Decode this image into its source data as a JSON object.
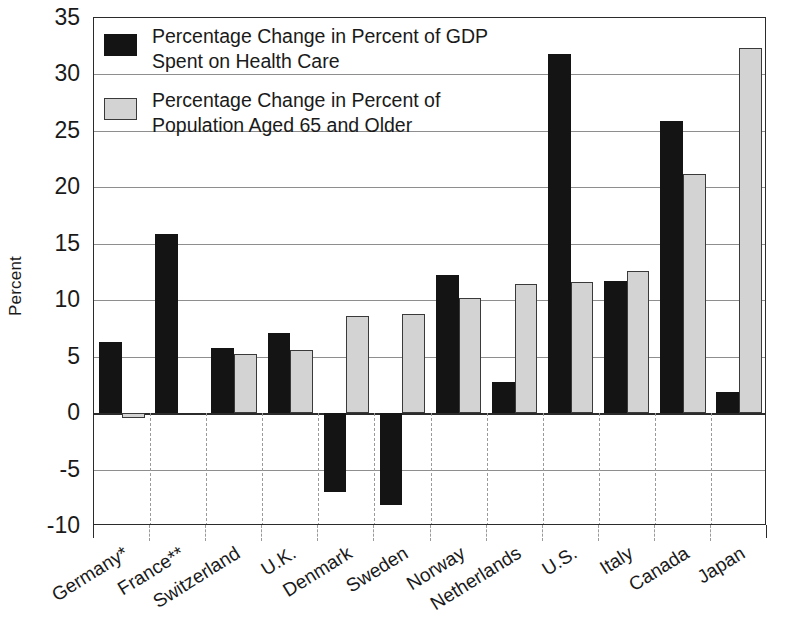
{
  "chart_data": {
    "type": "bar",
    "title": "",
    "xlabel": "",
    "ylabel": "Percent",
    "ylim": [
      -10,
      35
    ],
    "ytick_step": 5,
    "yticks": [
      "35",
      "30",
      "25",
      "20",
      "15",
      "10",
      "5",
      "0",
      "-5",
      "-10"
    ],
    "grid": true,
    "legend_position": "upper-left-inside",
    "categories": [
      "Germany*",
      "France**",
      "Switzerland",
      "U.K.",
      "Denmark",
      "Sweden",
      "Norway",
      "Netherlands",
      "U.S.",
      "Italy",
      "Canada",
      "Japan"
    ],
    "series": [
      {
        "name": "Percentage Change in Percent of GDP Spent on Health Care",
        "color": "#141414",
        "values": [
          6.3,
          15.9,
          5.8,
          7.1,
          -7.0,
          -8.1,
          12.2,
          2.8,
          31.8,
          11.7,
          25.9,
          1.9
        ]
      },
      {
        "name": "Percentage Change in Percent of Population Aged 65 and Older",
        "color": "#d3d3d3",
        "values": [
          -0.45,
          null,
          5.2,
          5.6,
          8.6,
          8.8,
          10.2,
          11.4,
          11.6,
          12.6,
          21.2,
          32.3
        ]
      }
    ]
  },
  "legend": {
    "items": [
      {
        "swatch": "dark",
        "label": "Percentage Change in Percent of GDP Spent on Health Care"
      },
      {
        "swatch": "light",
        "label": "Percentage Change in Percent of Population Aged 65 and Older"
      }
    ]
  },
  "axis": {
    "y_title": "Percent"
  },
  "colors": {
    "series_dark": "#141414",
    "series_light": "#d3d3d3",
    "axis": "#2b2b2b",
    "grid": "#8e8e8e",
    "background": "#ffffff"
  }
}
